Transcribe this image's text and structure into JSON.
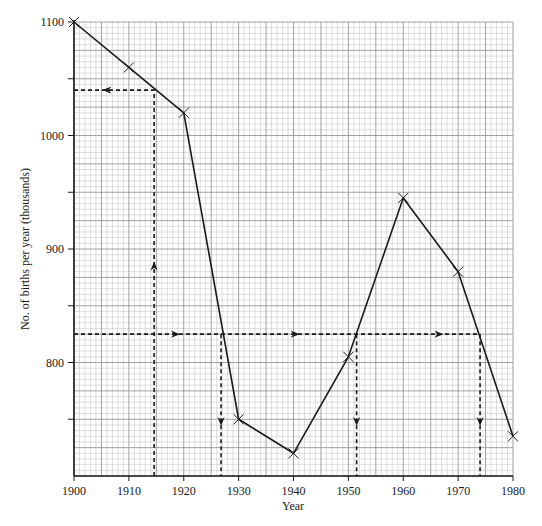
{
  "chart_data": {
    "type": "line",
    "title": "",
    "xlabel": "Year",
    "ylabel": "No. of births per year (thousands)",
    "x": [
      1900,
      1910,
      1920,
      1930,
      1940,
      1950,
      1960,
      1970,
      1980
    ],
    "series": [
      {
        "name": "Births per year",
        "values": [
          1100,
          1060,
          1020,
          750,
          720,
          805,
          945,
          880,
          735
        ],
        "marker": "x",
        "color": "#1a1a1a"
      }
    ],
    "xlim": [
      1900,
      1980
    ],
    "ylim": [
      700,
      1100
    ],
    "x_ticks": [
      1900,
      1910,
      1920,
      1930,
      1940,
      1950,
      1960,
      1970,
      1980
    ],
    "y_ticks_labeled": [
      800,
      900,
      1000,
      1100
    ],
    "y_ticks_minor_marks": [
      750,
      850,
      950,
      1050
    ],
    "grid": true,
    "grid_minor_x_step": 1,
    "grid_minor_y_step": 5,
    "grid_major_x_step": 5,
    "grid_major_y_step": 25,
    "legend": "none",
    "annotations": [
      {
        "type": "dashed-reading",
        "description": "Reading from year to births: vertical up from x=1914.6 to curve, then horizontal left to y-axis",
        "x": 1914.6,
        "y": 1040,
        "arrows": [
          "up",
          "left"
        ]
      },
      {
        "type": "dashed-reading",
        "description": "Horizontal line at 825 thousand intersecting the curve at four years, then vertical down to x-axis",
        "y": 825,
        "x_intersections": [
          1926.8,
          1951.5,
          1974.0
        ],
        "arrows": [
          "right",
          "right",
          "right",
          "down",
          "down",
          "down"
        ]
      }
    ]
  },
  "axes": {
    "x_label": "Year",
    "y_label": "No. of births per year (thousands)",
    "x_tick_labels": [
      "1900",
      "1910",
      "1920",
      "1930",
      "1940",
      "1950",
      "1960",
      "1970",
      "1980"
    ],
    "y_tick_labels": [
      "800",
      "900",
      "1000",
      "1100"
    ]
  }
}
